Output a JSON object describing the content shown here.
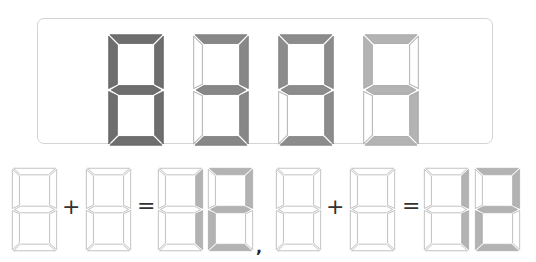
{
  "panel": {
    "digits": [
      {
        "value": "8",
        "segments": {
          "a": 1,
          "b": 1,
          "c": 1,
          "d": 1,
          "e": 1,
          "f": 1,
          "g": 1
        },
        "color": "#6e6e6e"
      },
      {
        "value": "3",
        "segments": {
          "a": 1,
          "b": 1,
          "c": 1,
          "d": 1,
          "e": 0,
          "f": 0,
          "g": 1
        },
        "color": "#878787"
      },
      {
        "value": "9",
        "segments": {
          "a": 1,
          "b": 1,
          "c": 1,
          "d": 1,
          "e": 0,
          "f": 1,
          "g": 1
        },
        "color": "#8c8c8c"
      },
      {
        "value": "5",
        "segments": {
          "a": 1,
          "b": 0,
          "c": 1,
          "d": 1,
          "e": 0,
          "f": 1,
          "g": 1
        },
        "color": "#b3b3b3"
      }
    ]
  },
  "equations": [
    {
      "operand1": {
        "segments": {
          "a": 0,
          "b": 0,
          "c": 0,
          "d": 0,
          "e": 0,
          "f": 0,
          "g": 0
        }
      },
      "plus": "+",
      "operand2": {
        "segments": {
          "a": 0,
          "b": 0,
          "c": 0,
          "d": 0,
          "e": 0,
          "f": 0,
          "g": 0
        }
      },
      "equals": "=",
      "result": [
        {
          "value": "1",
          "segments": {
            "a": 0,
            "b": 1,
            "c": 1,
            "d": 0,
            "e": 0,
            "f": 0,
            "g": 0
          }
        },
        {
          "value": "2",
          "segments": {
            "a": 1,
            "b": 1,
            "c": 0,
            "d": 1,
            "e": 1,
            "f": 0,
            "g": 1
          }
        }
      ],
      "separator": ","
    },
    {
      "operand1": {
        "segments": {
          "a": 0,
          "b": 0,
          "c": 0,
          "d": 0,
          "e": 0,
          "f": 0,
          "g": 0
        }
      },
      "plus": "+",
      "operand2": {
        "segments": {
          "a": 0,
          "b": 0,
          "c": 0,
          "d": 0,
          "e": 0,
          "f": 0,
          "g": 0
        }
      },
      "equals": "=",
      "result": [
        {
          "value": "1",
          "segments": {
            "a": 0,
            "b": 1,
            "c": 1,
            "d": 0,
            "e": 0,
            "f": 0,
            "g": 0
          }
        },
        {
          "value": "2",
          "segments": {
            "a": 1,
            "b": 1,
            "c": 0,
            "d": 1,
            "e": 1,
            "f": 0,
            "g": 1
          }
        }
      ]
    }
  ],
  "colors": {
    "lit_bottom": "#b3b3b3",
    "off_fill": "#ffffff",
    "off_stroke": "#b8b8b8",
    "panel_border": "#d4d4d4"
  }
}
